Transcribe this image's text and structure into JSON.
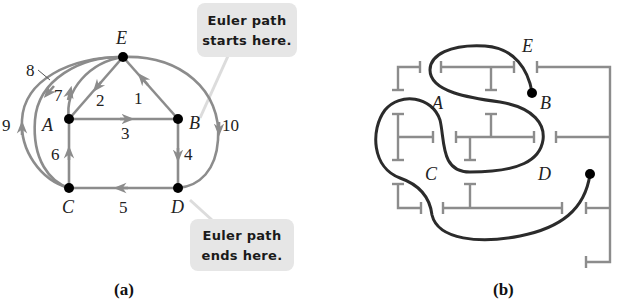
{
  "panel_a": {
    "caption": "(a)",
    "vertices": {
      "E": "E",
      "A": "A",
      "B": "B",
      "C": "C",
      "D": "D"
    },
    "edge_labels": [
      "1",
      "2",
      "3",
      "4",
      "5",
      "6",
      "7",
      "8",
      "9",
      "10"
    ],
    "callout_start": {
      "line1": "Euler path",
      "line2": "starts here."
    },
    "callout_end": {
      "line1": "Euler path",
      "line2": "ends here."
    }
  },
  "panel_b": {
    "caption": "(b)",
    "room_labels": {
      "E": "E",
      "A": "A",
      "B": "B",
      "C": "C",
      "D": "D"
    }
  },
  "colors": {
    "edge_gray": "#8c8c8c",
    "path_dark": "#2b2b2b",
    "vertex_black": "#000000",
    "callout_bg": "#e6e6e6"
  }
}
